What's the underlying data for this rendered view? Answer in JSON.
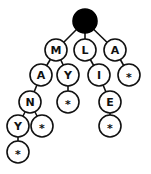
{
  "diagram": {
    "type": "trie",
    "root": {
      "id": "root",
      "label": "",
      "filled": true,
      "x": 85,
      "y": 21,
      "r": 12
    },
    "nodes": [
      {
        "id": "n1",
        "label": "M",
        "x": 56,
        "y": 50,
        "parent": "root"
      },
      {
        "id": "n2",
        "label": "L",
        "x": 85,
        "y": 50,
        "parent": "root"
      },
      {
        "id": "n3",
        "label": "A",
        "x": 115,
        "y": 50,
        "parent": "root"
      },
      {
        "id": "n4",
        "label": "A",
        "x": 41,
        "y": 75,
        "parent": "n1"
      },
      {
        "id": "n5",
        "label": "Y",
        "x": 68,
        "y": 75,
        "parent": "n1"
      },
      {
        "id": "n6",
        "label": "I",
        "x": 99,
        "y": 75,
        "parent": "n2"
      },
      {
        "id": "n7",
        "label": "*",
        "x": 129,
        "y": 75,
        "parent": "n3"
      },
      {
        "id": "n8",
        "label": "N",
        "x": 30,
        "y": 102,
        "parent": "n4"
      },
      {
        "id": "n9",
        "label": "*",
        "x": 68,
        "y": 102,
        "parent": "n5"
      },
      {
        "id": "n10",
        "label": "E",
        "x": 110,
        "y": 102,
        "parent": "n6"
      },
      {
        "id": "n11",
        "label": "Y",
        "x": 18,
        "y": 126,
        "parent": "n8"
      },
      {
        "id": "n12",
        "label": "*",
        "x": 42,
        "y": 126,
        "parent": "n8"
      },
      {
        "id": "n13",
        "label": "*",
        "x": 110,
        "y": 126,
        "parent": "n10"
      },
      {
        "id": "n14",
        "label": "*",
        "x": 18,
        "y": 152,
        "parent": "n11"
      }
    ],
    "node_radius": 11
  }
}
